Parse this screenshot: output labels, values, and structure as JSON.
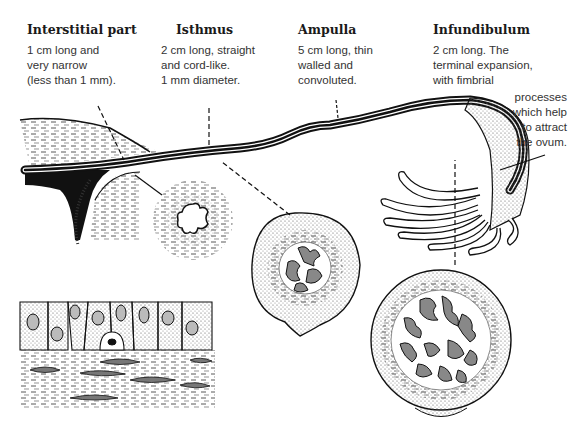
{
  "figure": {
    "sections": [
      {
        "id": "interstitial",
        "title": "Interstitial part",
        "description": [
          "1 cm long and",
          "very narrow",
          "(less than 1 mm)."
        ]
      },
      {
        "id": "isthmus",
        "title": "Isthmus",
        "description": [
          "2 cm long, straight",
          "and cord-like.",
          "1 mm diameter."
        ]
      },
      {
        "id": "ampulla",
        "title": "Ampulla",
        "description": [
          "5 cm long, thin",
          "walled and",
          "convoluted."
        ]
      },
      {
        "id": "infundibulum",
        "title": "Infundibulum",
        "description": [
          "2 cm long. The",
          "terminal expansion,",
          "with fimbrial"
        ],
        "description_continued": [
          "processes",
          "which help",
          "to attract",
          "the ovum."
        ]
      }
    ],
    "insets": [
      {
        "name": "epithelium-histology-inset"
      },
      {
        "name": "isthmus-cross-section"
      },
      {
        "name": "ampulla-cross-section"
      },
      {
        "name": "infundibulum-cross-section"
      }
    ]
  }
}
